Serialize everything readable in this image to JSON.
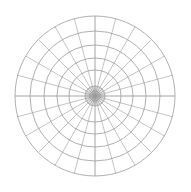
{
  "diagram": {
    "type": "polar-grid",
    "center": [
      95,
      96
    ],
    "rings": [
      5,
      10,
      26,
      38,
      51,
      65,
      80
    ],
    "spokes": 24,
    "spoke_step_deg": 15,
    "inner_radius_for_spokes": 10,
    "line_color": "#9a9a9a",
    "background": "#ffffff"
  }
}
